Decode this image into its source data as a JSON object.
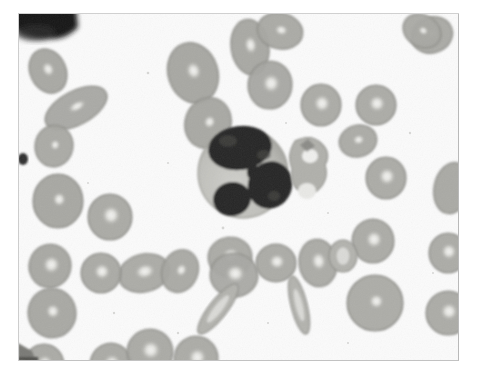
{
  "image": {
    "kind": "light-microscopy-photomicrograph",
    "subject": "peripheral blood smear",
    "stain": "Wright-Giemsa",
    "background_color": "#fbfbfb",
    "page_background_color": "#ffffff",
    "frame": {
      "x": 18,
      "y": 13,
      "width": 441,
      "height": 348,
      "border_color": "#bcbcbc"
    },
    "palette": {
      "erythrocyte_fill": "#b3b3ae",
      "erythrocyte_fill_dark": "#9a9a95",
      "erythrocyte_rim": "#8d8d88",
      "central_pallor": "#f4f4f2",
      "leukocyte_cytoplasm": "#c3c3bf",
      "leukocyte_nucleus": "#272726",
      "platelet": "#a8a8a3",
      "corner_artifact": "#111111",
      "debris": "#9d9d98"
    },
    "caption": "",
    "labels": []
  },
  "cells": {
    "leukocyte": {
      "name": "neutrophil",
      "cx": 225,
      "cy": 160,
      "r": 45,
      "lobes": 3,
      "note": "central segmented white blood cell with dark multilobed nucleus"
    },
    "platelet_cluster": {
      "cx": 290,
      "cy": 155,
      "note": "platelet / cell debris adjacent to the leukocyte"
    },
    "erythrocyte_count_visible": 34,
    "erythrocytes": [
      {
        "cx": 30,
        "cy": 58,
        "rx": 18,
        "ry": 23,
        "rot": -25,
        "pallor": 0.3,
        "tone": 0.58
      },
      {
        "cx": 58,
        "cy": 95,
        "rx": 34,
        "ry": 17,
        "rot": -28,
        "pallor": 0.18,
        "tone": 0.52
      },
      {
        "cx": 36,
        "cy": 133,
        "rx": 19,
        "ry": 21,
        "rot": 10,
        "pallor": 0.1,
        "tone": 0.48
      },
      {
        "cx": 40,
        "cy": 188,
        "rx": 25,
        "ry": 27,
        "rot": 0,
        "pallor": 0.12,
        "tone": 0.62
      },
      {
        "cx": 32,
        "cy": 253,
        "rx": 21,
        "ry": 22,
        "rot": 15,
        "pallor": 0.52,
        "tone": 0.55
      },
      {
        "cx": 34,
        "cy": 300,
        "rx": 24,
        "ry": 25,
        "rot": -10,
        "pallor": 0.2,
        "tone": 0.55
      },
      {
        "cx": 26,
        "cy": 352,
        "rx": 20,
        "ry": 21,
        "rot": 0,
        "pallor": 0.5,
        "tone": 0.48
      },
      {
        "cx": 92,
        "cy": 204,
        "rx": 22,
        "ry": 23,
        "rot": 0,
        "pallor": 0.55,
        "tone": 0.48
      },
      {
        "cx": 93,
        "cy": 352,
        "rx": 21,
        "ry": 22,
        "rot": 0,
        "pallor": 0.55,
        "tone": 0.5
      },
      {
        "cx": 132,
        "cy": 339,
        "rx": 23,
        "ry": 23,
        "rot": -12,
        "pallor": 0.55,
        "tone": 0.48
      },
      {
        "cx": 178,
        "cy": 346,
        "rx": 22,
        "ry": 23,
        "rot": 8,
        "pallor": 0.52,
        "tone": 0.46
      },
      {
        "cx": 175,
        "cy": 60,
        "rx": 25,
        "ry": 31,
        "rot": -18,
        "pallor": 0.22,
        "tone": 0.6
      },
      {
        "cx": 190,
        "cy": 110,
        "rx": 23,
        "ry": 26,
        "rot": 20,
        "pallor": 0.1,
        "tone": 0.58
      },
      {
        "cx": 232,
        "cy": 34,
        "rx": 19,
        "ry": 28,
        "rot": -8,
        "pallor": 0.3,
        "tone": 0.55
      },
      {
        "cx": 252,
        "cy": 72,
        "rx": 22,
        "ry": 24,
        "rot": 5,
        "pallor": 0.5,
        "tone": 0.52
      },
      {
        "cx": 262,
        "cy": 18,
        "rx": 23,
        "ry": 18,
        "rot": 12,
        "pallor": 0.2,
        "tone": 0.5
      },
      {
        "cx": 303,
        "cy": 92,
        "rx": 20,
        "ry": 21,
        "rot": 0,
        "pallor": 0.55,
        "tone": 0.46
      },
      {
        "cx": 358,
        "cy": 92,
        "rx": 20,
        "ry": 20,
        "rot": 0,
        "pallor": 0.55,
        "tone": 0.44
      },
      {
        "cx": 340,
        "cy": 128,
        "rx": 19,
        "ry": 16,
        "rot": -15,
        "pallor": 0.25,
        "tone": 0.44
      },
      {
        "cx": 368,
        "cy": 165,
        "rx": 20,
        "ry": 21,
        "rot": 0,
        "pallor": 0.55,
        "tone": 0.46
      },
      {
        "cx": 414,
        "cy": 22,
        "rx": 21,
        "ry": 18,
        "rot": -20,
        "pallor": 0.25,
        "tone": 0.48
      },
      {
        "cx": 434,
        "cy": 175,
        "rx": 18,
        "ry": 26,
        "rot": 12,
        "pallor": 0.05,
        "tone": 0.52
      },
      {
        "cx": 355,
        "cy": 228,
        "rx": 21,
        "ry": 22,
        "rot": 0,
        "pallor": 0.5,
        "tone": 0.46
      },
      {
        "cx": 430,
        "cy": 240,
        "rx": 19,
        "ry": 20,
        "rot": 0,
        "pallor": 0.52,
        "tone": 0.44
      },
      {
        "cx": 300,
        "cy": 250,
        "rx": 19,
        "ry": 24,
        "rot": -8,
        "pallor": 0.48,
        "tone": 0.46
      },
      {
        "cx": 357,
        "cy": 290,
        "rx": 28,
        "ry": 28,
        "rot": 0,
        "pallor": 0.14,
        "tone": 0.42
      },
      {
        "cx": 430,
        "cy": 300,
        "rx": 22,
        "ry": 22,
        "rot": 0,
        "pallor": 0.48,
        "tone": 0.44
      },
      {
        "cx": 212,
        "cy": 244,
        "rx": 22,
        "ry": 20,
        "rot": -6,
        "pallor": 0.45,
        "tone": 0.46
      },
      {
        "cx": 216,
        "cy": 262,
        "rx": 24,
        "ry": 22,
        "rot": 5,
        "pallor": 0.5,
        "tone": 0.46
      },
      {
        "cx": 258,
        "cy": 250,
        "rx": 20,
        "ry": 19,
        "rot": 0,
        "pallor": 0.5,
        "tone": 0.44
      },
      {
        "cx": 126,
        "cy": 260,
        "rx": 26,
        "ry": 19,
        "rot": -14,
        "pallor": 0.48,
        "tone": 0.46
      },
      {
        "cx": 162,
        "cy": 258,
        "rx": 18,
        "ry": 22,
        "rot": 22,
        "pallor": 0.22,
        "tone": 0.48
      },
      {
        "cx": 83,
        "cy": 260,
        "rx": 20,
        "ry": 20,
        "rot": 0,
        "pallor": 0.5,
        "tone": 0.48
      },
      {
        "cx": 404,
        "cy": 18,
        "rx": 20,
        "ry": 16,
        "rot": 30,
        "pallor": 0.1,
        "tone": 0.46
      }
    ],
    "elongated_forms": [
      {
        "name": "echinocyte-sliver-left",
        "cx": 200,
        "cy": 296,
        "rx": 9,
        "ry": 31,
        "rot": 38
      },
      {
        "name": "echinocyte-sliver-right",
        "cx": 281,
        "cy": 292,
        "rx": 8,
        "ry": 30,
        "rot": -14
      },
      {
        "name": "ring-form",
        "cx": 325,
        "cy": 243,
        "rx": 14,
        "ry": 16,
        "rot": 0
      }
    ],
    "artifacts": [
      {
        "name": "corner-blot-top-left",
        "x": 0,
        "y": 0,
        "w": 60,
        "h": 30
      },
      {
        "name": "corner-blot-bottom-left",
        "x": 0,
        "y": 325,
        "w": 18,
        "h": 23
      },
      {
        "name": "dark-speck-left",
        "x": 4,
        "y": 140,
        "w": 8,
        "h": 10
      }
    ]
  }
}
